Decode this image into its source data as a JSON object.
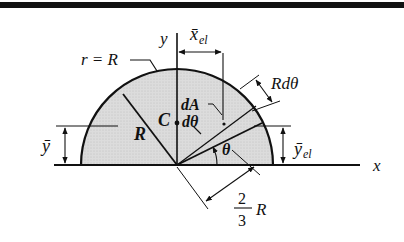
{
  "figure": {
    "colors": {
      "fill": "#d9d9d9",
      "stroke": "#111111",
      "top_rule": "#111111"
    },
    "labels": {
      "radius_callout": "r = R",
      "y_axis": "y",
      "x_axis": "x",
      "x_bar_el": "x̄",
      "x_bar_el_sub": "el",
      "radius": "R",
      "centroid": "C",
      "dA": "dA",
      "dtheta": "dθ",
      "R_dtheta": "Rdθ",
      "theta": "θ",
      "y_bar": "ȳ",
      "y_bar_el": "ȳ",
      "y_bar_el_sub": "el",
      "two_thirds_num": "2",
      "two_thirds_den": "3",
      "two_thirds_R": "R"
    }
  }
}
